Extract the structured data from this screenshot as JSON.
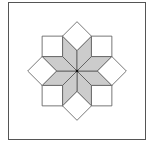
{
  "figure": {
    "colors": {
      "background": "#ffffff",
      "fill_gray": "#cccccc",
      "fill_white": "#ffffff",
      "stroke": "#555555",
      "center_dot": "#111111"
    },
    "pieces": {
      "star_rhombi": 8,
      "corner_squares": 4,
      "edge_diamonds": 4,
      "border_trapezoids": 8,
      "corner_triangles": 4
    }
  }
}
